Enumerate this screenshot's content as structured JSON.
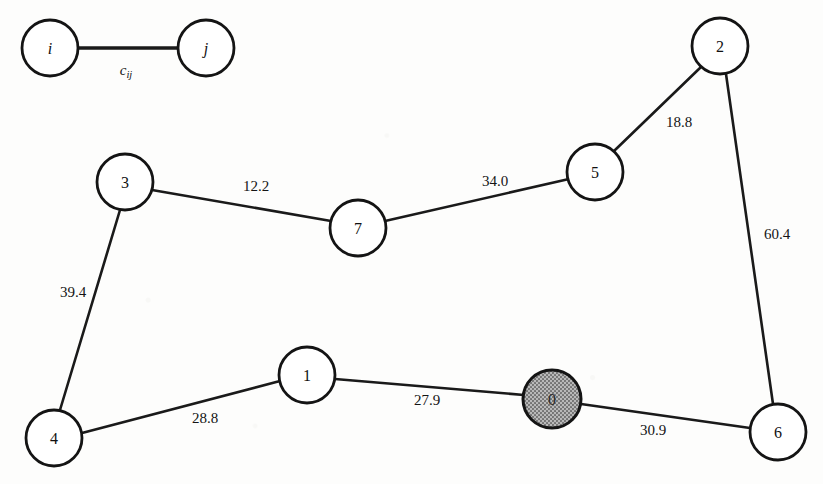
{
  "figure": {
    "width": 823,
    "height": 484,
    "background_color": "#fdfdfc",
    "ink_color": "#141414",
    "shaded_node_fill": "#9a9a9a"
  },
  "legend": {
    "node_i": {
      "label": "i",
      "cx": 50,
      "cy": 48,
      "r": 28
    },
    "node_j": {
      "label": "j",
      "cx": 206,
      "cy": 48,
      "r": 28
    },
    "edge": {
      "x1": 78,
      "y1": 48,
      "x2": 178,
      "y2": 48
    },
    "cost_symbol": {
      "base": "c",
      "subscript": "ij",
      "x": 126,
      "y": 70
    }
  },
  "graph": {
    "type": "undirected-weighted-graph",
    "nodes": [
      {
        "id": "0",
        "label": "0",
        "cx": 552,
        "cy": 399,
        "r": 29,
        "shaded": true
      },
      {
        "id": "1",
        "label": "1",
        "cx": 307,
        "cy": 375,
        "r": 28,
        "shaded": false
      },
      {
        "id": "2",
        "label": "2",
        "cx": 720,
        "cy": 46,
        "r": 28,
        "shaded": false
      },
      {
        "id": "3",
        "label": "3",
        "cx": 125,
        "cy": 182,
        "r": 28,
        "shaded": false
      },
      {
        "id": "4",
        "label": "4",
        "cx": 54,
        "cy": 438,
        "r": 28,
        "shaded": false
      },
      {
        "id": "5",
        "label": "5",
        "cx": 595,
        "cy": 172,
        "r": 28,
        "shaded": false
      },
      {
        "id": "6",
        "label": "6",
        "cx": 778,
        "cy": 432,
        "r": 28,
        "shaded": false
      },
      {
        "id": "7",
        "label": "7",
        "cx": 358,
        "cy": 228,
        "r": 28,
        "shaded": false
      }
    ],
    "edges": [
      {
        "source": "3",
        "target": "7",
        "weight": "12.2",
        "label_x": 256,
        "label_y": 186
      },
      {
        "source": "7",
        "target": "5",
        "weight": "34.0",
        "label_x": 495,
        "label_y": 181
      },
      {
        "source": "5",
        "target": "2",
        "weight": "18.8",
        "label_x": 679,
        "label_y": 122
      },
      {
        "source": "2",
        "target": "6",
        "weight": "60.4",
        "label_x": 777,
        "label_y": 234
      },
      {
        "source": "3",
        "target": "4",
        "weight": "39.4",
        "label_x": 73,
        "label_y": 292
      },
      {
        "source": "4",
        "target": "1",
        "weight": "28.8",
        "label_x": 205,
        "label_y": 418
      },
      {
        "source": "1",
        "target": "0",
        "weight": "27.9",
        "label_x": 427,
        "label_y": 400
      },
      {
        "source": "0",
        "target": "6",
        "weight": "30.9",
        "label_x": 653,
        "label_y": 430
      }
    ]
  }
}
